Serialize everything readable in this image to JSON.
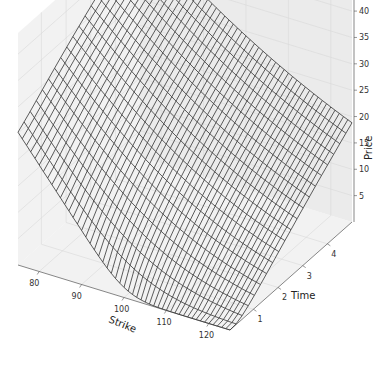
{
  "chart_data": {
    "type": "surface",
    "title": "",
    "xlabel": "Strike",
    "ylabel": "Time",
    "zlabel": "Price",
    "xlim": [
      75,
      125
    ],
    "ylim": [
      0.05,
      5
    ],
    "zlim": [
      0,
      44
    ],
    "x_ticks": [
      80,
      90,
      100,
      110,
      120
    ],
    "y_ticks": [
      1,
      2,
      3,
      4
    ],
    "z_ticks": [
      5,
      10,
      15,
      20,
      25,
      30,
      35,
      40
    ],
    "model": {
      "spot": 100,
      "rate": 0.05,
      "volatility": 0.2
    },
    "grid_x_count": 50,
    "grid_y_count": 20,
    "grid": true,
    "wireframe_color": "#333333",
    "corner_values": [
      {
        "strike": 75,
        "time": 0.05,
        "price": 25.2
      },
      {
        "strike": 125,
        "time": 0.05,
        "price": 0.0
      },
      {
        "strike": 75,
        "time": 5,
        "price": 43.0
      },
      {
        "strike": 125,
        "time": 5,
        "price": 18.0
      }
    ]
  },
  "labels": {
    "x": "Strike",
    "y": "Time",
    "z": "Price"
  }
}
